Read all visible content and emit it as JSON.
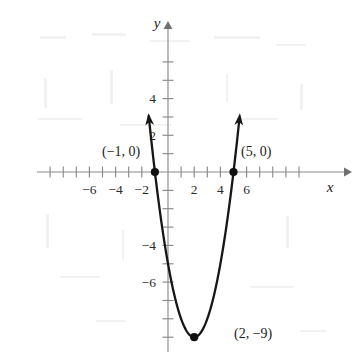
{
  "chart_data": {
    "type": "line",
    "title": "",
    "subtitle": "",
    "xlabel": "x",
    "ylabel": "y",
    "function": "y = (x + 1)(x - 5)",
    "expanded": "y = x^2 - 4x - 5",
    "xlim": [
      -10,
      13
    ],
    "ylim": [
      -11,
      7
    ],
    "grid": false,
    "legend": null,
    "x_tick_labels": [
      "-6",
      "-4",
      "-2",
      "2",
      "4",
      "6"
    ],
    "x_tick_values": [
      -6,
      -4,
      -2,
      2,
      4,
      6
    ],
    "x_ticks_all": [
      -9,
      -8,
      -7,
      -6,
      -5,
      -4,
      -3,
      -2,
      -1,
      1,
      2,
      3,
      4,
      5,
      6,
      7,
      8,
      9
    ],
    "y_tick_labels": [
      "4",
      "2",
      "-4",
      "-6"
    ],
    "y_tick_values": [
      4,
      2,
      -4,
      -6
    ],
    "y_ticks_all": [
      6,
      5,
      4,
      3,
      2,
      1,
      -1,
      -2,
      -3,
      -4,
      -5,
      -6,
      -7,
      -8,
      -9,
      -10
    ],
    "series": [
      {
        "name": "parabola",
        "x": [
          -1.45,
          -1.2,
          -1,
          -0.5,
          0,
          0.5,
          1,
          1.5,
          2,
          2.5,
          3,
          3.5,
          4,
          4.5,
          5,
          5.2,
          5.45
        ],
        "y": [
          1.5,
          -0.16,
          0,
          -2.75,
          -5,
          -6.75,
          -8,
          -8.75,
          -9,
          -8.75,
          -8,
          -6.75,
          -5,
          -2.75,
          0,
          0.96,
          2.3
        ]
      }
    ],
    "annotations": [
      {
        "id": "left-root",
        "text": "(−1, 0)",
        "point": [
          -1,
          0
        ],
        "label_x": -4.2,
        "label_y": 1.6
      },
      {
        "id": "right-root",
        "text": "(5, 0)",
        "point": [
          5,
          0
        ],
        "label_x": 5.6,
        "label_y": 1.6
      },
      {
        "id": "vertex",
        "text": "(2, −9)",
        "point": [
          2,
          -9
        ],
        "label_x": 3.7,
        "label_y": -9.6
      }
    ],
    "marked_points": [
      {
        "label": "(−1, 0)",
        "x": -1,
        "y": 0
      },
      {
        "label": "(5, 0)",
        "x": 5,
        "y": 0
      },
      {
        "label": "(2, −9)",
        "x": 2,
        "y": -9
      }
    ],
    "colors": {
      "curve": "#161616",
      "axis": "#8a8a8a",
      "text": "#1c1c1c",
      "background": "#ffffff",
      "marker": "#111111"
    }
  },
  "axes": {
    "x_axis_label": "x",
    "y_axis_label": "y"
  },
  "labels": {
    "left_root": "(−1, 0)",
    "right_root": "(5, 0)",
    "vertex": "(2, −9)",
    "x_neg6": "−6",
    "x_neg4": "−4",
    "x_neg2": "−2",
    "x_pos2": "2",
    "x_pos4": "4",
    "x_pos6": "6",
    "y_pos4": "4",
    "y_pos2": "2",
    "y_neg4": "−4",
    "y_neg6": "−6"
  }
}
